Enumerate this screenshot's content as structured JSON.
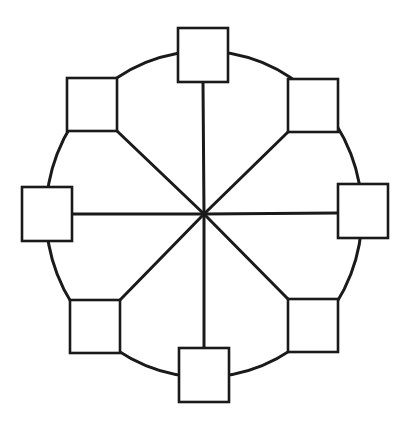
{
  "diagram": {
    "type": "ring-star hybrid network topology",
    "top_text_residue": "",
    "center": {
      "x": 204,
      "y": 214
    },
    "ring": {
      "cx": 204,
      "cy": 214,
      "rx": 158,
      "ry": 163
    },
    "line_color": "#1a1a1a",
    "fill_color": "#ffffff",
    "nodes": [
      {
        "id": "node-top",
        "x": 178,
        "y": 28,
        "w": 50,
        "h": 54
      },
      {
        "id": "node-upper-right",
        "x": 288,
        "y": 79,
        "w": 50,
        "h": 53
      },
      {
        "id": "node-right",
        "x": 338,
        "y": 184,
        "w": 50,
        "h": 54
      },
      {
        "id": "node-lower-right",
        "x": 288,
        "y": 299,
        "w": 50,
        "h": 53
      },
      {
        "id": "node-bottom",
        "x": 179,
        "y": 348,
        "w": 50,
        "h": 54
      },
      {
        "id": "node-lower-left",
        "x": 70,
        "y": 300,
        "w": 50,
        "h": 53
      },
      {
        "id": "node-left",
        "x": 22,
        "y": 187,
        "w": 50,
        "h": 54
      },
      {
        "id": "node-upper-left",
        "x": 67,
        "y": 78,
        "w": 50,
        "h": 53
      }
    ],
    "spokes": [
      {
        "to": "node-top",
        "x2": 203,
        "y2": 82
      },
      {
        "to": "node-upper-right",
        "x2": 288,
        "y2": 132
      },
      {
        "to": "node-right",
        "x2": 338,
        "y2": 213
      },
      {
        "to": "node-lower-right",
        "x2": 288,
        "y2": 299
      },
      {
        "to": "node-bottom",
        "x2": 204,
        "y2": 348
      },
      {
        "to": "node-lower-left",
        "x2": 120,
        "y2": 300
      },
      {
        "to": "node-left",
        "x2": 72,
        "y2": 214
      },
      {
        "to": "node-upper-left",
        "x2": 117,
        "y2": 131
      }
    ]
  }
}
